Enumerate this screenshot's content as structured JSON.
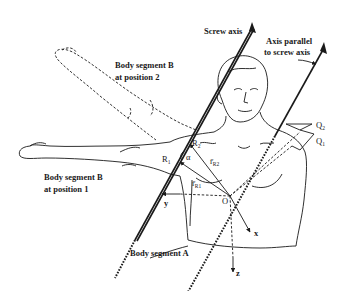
{
  "diagram": {
    "labels": {
      "screw_axis": "Screw axis",
      "parallel_axis_line1": "Axis parallel",
      "parallel_axis_line2": "to screw axis",
      "segment_b_pos2_line1": "Body segment B",
      "segment_b_pos2_line2": "at position 2",
      "segment_b_pos1_line1": "Body segment B",
      "segment_b_pos1_line2": "at position 1",
      "segment_a": "Body segment A"
    },
    "symbols": {
      "R2": "R",
      "R2_sub": "2",
      "R1": "R",
      "R1_sub": "1",
      "alpha": "α",
      "rR2": "r̄",
      "rR2_sub": "R2",
      "rR1": "r̄",
      "rR1_sub": "R1",
      "Q2": "Q",
      "Q2_sub": "2",
      "Q1": "Q",
      "Q1_sub": "1",
      "origin": "O",
      "x": "x",
      "y": "y",
      "z": "z"
    },
    "colors": {
      "ink": "#1a1a1a",
      "background": "#ffffff"
    }
  }
}
